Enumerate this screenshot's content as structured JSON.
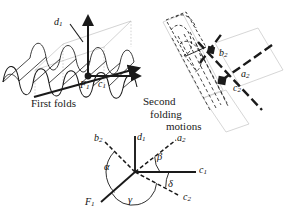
{
  "figure": {
    "title_present": false,
    "background_color": "#ffffff",
    "ink_color": "#1a1a1a",
    "faint_color": "#b8b8b8",
    "panels": [
      {
        "id": "panel-first-folds",
        "caption": "First folds",
        "vertex_label": "F",
        "vertex_sub": "1",
        "axis_labels": [
          {
            "name": "d",
            "sub": "1"
          },
          {
            "name": "c",
            "sub": "1"
          }
        ]
      },
      {
        "id": "panel-second-folding",
        "caption_line1": "Second",
        "caption_line2": "folding",
        "caption_line3": "motions",
        "axis_labels": [
          {
            "name": "b",
            "sub": "2"
          },
          {
            "name": "a",
            "sub": "2"
          },
          {
            "name": "c",
            "sub": "2"
          }
        ]
      },
      {
        "id": "panel-angle-diagram",
        "rays": [
          {
            "name": "d",
            "sub": "1",
            "style": "solid",
            "direction": "up"
          },
          {
            "name": "a",
            "sub": "2",
            "style": "dashed",
            "direction": "upper-right"
          },
          {
            "name": "c",
            "sub": "1",
            "style": "solid",
            "direction": "right"
          },
          {
            "name": "c",
            "sub": "2",
            "style": "dashed",
            "direction": "lower-right"
          },
          {
            "name": "F",
            "sub": "1",
            "style": "solid",
            "direction": "lower-left"
          },
          {
            "name": "b",
            "sub": "2",
            "style": "dashed",
            "direction": "upper-left"
          }
        ],
        "angles": [
          {
            "symbol": "α",
            "name": "alpha"
          },
          {
            "symbol": "β",
            "name": "beta"
          },
          {
            "symbol": "γ",
            "name": "gamma"
          },
          {
            "symbol": "δ",
            "name": "delta"
          }
        ]
      }
    ]
  },
  "labels": {
    "first_folds": "First folds",
    "second": "Second",
    "folding": "folding",
    "motions": "motions",
    "d1_name": "d",
    "d1_sub": "1",
    "c1_name": "c",
    "c1_sub": "1",
    "F1_name": "F",
    "F1_sub": "1",
    "b2_name": "b",
    "b2_sub": "2",
    "a2_name": "a",
    "a2_sub": "2",
    "c2_name": "c",
    "c2_sub": "2",
    "alpha": "α",
    "beta": "β",
    "gamma": "γ",
    "delta": "δ"
  }
}
